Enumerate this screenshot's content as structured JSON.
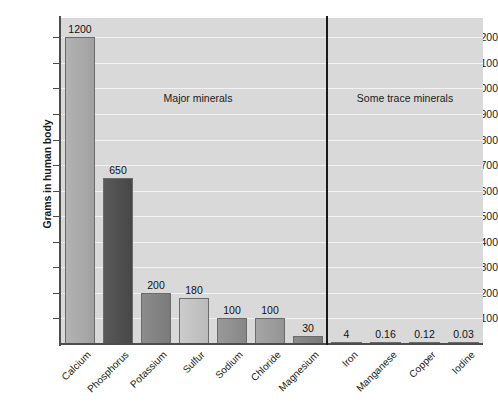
{
  "chart_data": {
    "type": "bar",
    "title": "",
    "xlabel": "",
    "ylabel": "Grams in human body",
    "ylim": [
      0,
      1275
    ],
    "grid": true,
    "legend": "none",
    "categories": [
      "Calcium",
      "Phosphorus",
      "Potassium",
      "Sulfur",
      "Sodium",
      "Chloride",
      "Magnesium",
      "Iron",
      "Manganese",
      "Copper",
      "Iodine"
    ],
    "values": [
      1200,
      650,
      200,
      180,
      100,
      100,
      30,
      4,
      0.16,
      0.12,
      0.03
    ],
    "value_labels": [
      "1200",
      "650",
      "200",
      "180",
      "100",
      "100",
      "30",
      "4",
      "0.16",
      "0.12",
      "0.03"
    ],
    "bar_colors": [
      "#b3b3b3",
      "#595959",
      "#8c8c8c",
      "#cccccc",
      "#999999",
      "#a6a6a6",
      "#8c8c8c",
      "#b3b3b3",
      "#b3b3b3",
      "#b3b3b3",
      "#b3b3b3"
    ],
    "ytick_labels": [
      "1200",
      "1100",
      "1000",
      "900",
      "800",
      "700",
      "600",
      "500",
      "400",
      "300",
      "200",
      "100"
    ],
    "ytick_values": [
      1200,
      1100,
      1000,
      900,
      800,
      700,
      600,
      500,
      400,
      300,
      200,
      100
    ],
    "annotations": [
      {
        "text": "Major minerals",
        "group": "major"
      },
      {
        "text": "Some trace minerals",
        "group": "trace"
      }
    ],
    "plot_background": "#d9d9d9",
    "gridline_color": "#f2f2f2",
    "axis_color": "#4d4d4d",
    "divider_color": "#1a1a1a"
  }
}
